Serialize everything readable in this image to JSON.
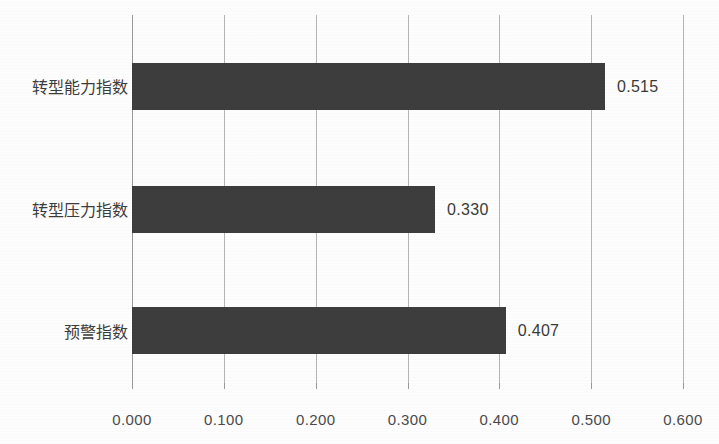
{
  "chart_data": {
    "type": "bar",
    "orientation": "horizontal",
    "title": "",
    "subtitle": "",
    "xlabel": "",
    "ylabel": "",
    "categories": [
      "转型能力指数",
      "转型压力指数",
      "预警指数"
    ],
    "values": [
      0.515,
      0.33,
      0.407
    ],
    "value_labels": [
      "0.515",
      "0.330",
      "0.407"
    ],
    "xlim": [
      0.0,
      0.6
    ],
    "xticks": [
      0.0,
      0.1,
      0.2,
      0.3,
      0.4,
      0.5,
      0.6
    ],
    "xtick_labels": [
      "0.000",
      "0.100",
      "0.200",
      "0.300",
      "0.400",
      "0.500",
      "0.600"
    ],
    "grid": "vertical-only",
    "legend": "none",
    "legend_position": "none",
    "data_labels_shown": true,
    "colors": {
      "bar_fill": "#3d3d3d",
      "gridline": "#b4b4b4",
      "axis_line": "#9a9a9a",
      "tick_label": "#4a4a4a",
      "category_label": "#3c3c3c",
      "value_label": "#3a3a3a",
      "background": "#fdfdfd"
    }
  }
}
